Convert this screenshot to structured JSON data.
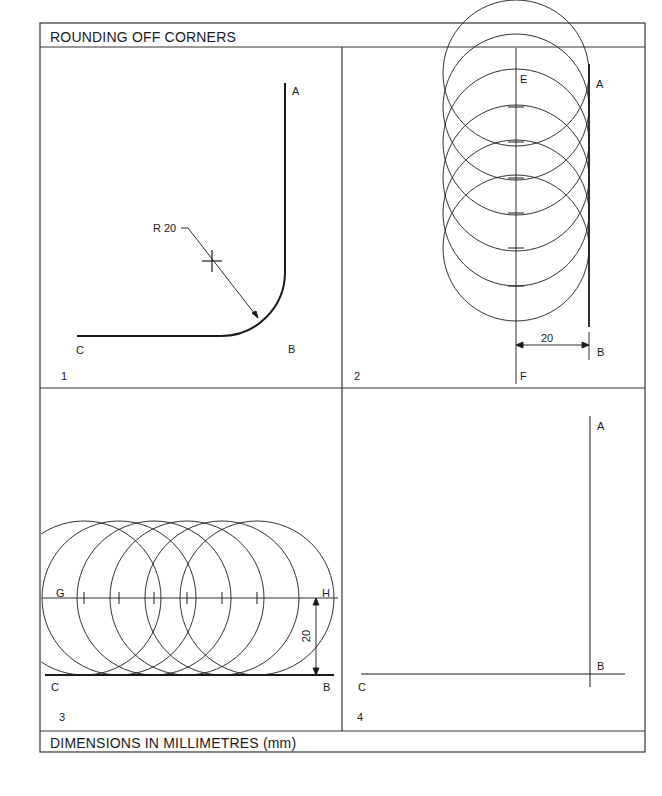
{
  "header": {
    "title": "ROUNDING OFF CORNERS"
  },
  "footer": {
    "note": "DIMENSIONS IN MILLIMETRES (mm)"
  },
  "panels": [
    {
      "number": "1",
      "labels": {
        "a": "A",
        "b": "B",
        "c": "C"
      },
      "radius_label": "R 20"
    },
    {
      "number": "2",
      "labels": {
        "a": "A",
        "b": "B",
        "e": "E",
        "f": "F"
      },
      "dimension": "20"
    },
    {
      "number": "3",
      "labels": {
        "b": "B",
        "c": "C",
        "g": "G",
        "h": "H"
      },
      "dimension": "20"
    },
    {
      "number": "4",
      "labels": {
        "a": "A",
        "b": "B",
        "c": "C"
      }
    }
  ],
  "colors": {
    "ink": "#1a1a1a",
    "paper": "#ffffff",
    "frame": "#333333"
  }
}
